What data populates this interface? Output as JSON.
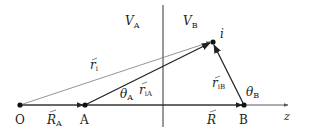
{
  "diagram": {
    "points": {
      "O": {
        "label": "O",
        "x": 20,
        "y": 105
      },
      "A": {
        "label": "A",
        "x": 85,
        "y": 105
      },
      "B": {
        "label": "B",
        "x": 244,
        "y": 105
      },
      "i": {
        "label": "i",
        "x": 213,
        "y": 42
      }
    },
    "regions": {
      "VA": {
        "main": "V",
        "sub": "A"
      },
      "VB": {
        "main": "V",
        "sub": "B"
      }
    },
    "vectors": {
      "r_i": {
        "main": "r",
        "sub": "i"
      },
      "r_iA": {
        "main": "r",
        "sub": "iA"
      },
      "r_iB": {
        "main": "r",
        "sub": "iB"
      },
      "R_A": {
        "main": "R",
        "sub": "A"
      },
      "R": {
        "main": "R",
        "sub": ""
      }
    },
    "angles": {
      "theta_A": {
        "main": "θ",
        "sub": "A"
      },
      "theta_B": {
        "main": "θ",
        "sub": "B"
      }
    },
    "axis": {
      "label": "z"
    },
    "colors": {
      "line": "#222222",
      "thin_line": "#555555"
    }
  }
}
